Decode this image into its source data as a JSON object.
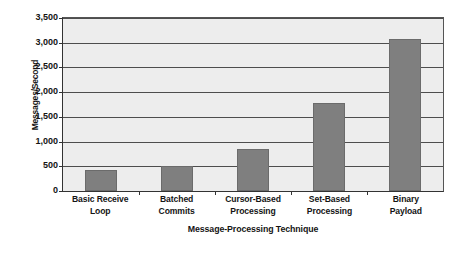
{
  "chart_data": {
    "type": "bar",
    "title": "",
    "xlabel": "Message-Processing Technique",
    "ylabel": "Messages/Second",
    "categories": [
      "Basic Receive\nLoop",
      "Batched\nCommits",
      "Cursor-Based\nProcessing",
      "Set-Based\nProcessing",
      "Binary\nPayload"
    ],
    "category_lines": [
      [
        "Basic Receive",
        "Loop"
      ],
      [
        "Batched",
        "Commits"
      ],
      [
        "Cursor-Based",
        "Processing"
      ],
      [
        "Set-Based",
        "Processing"
      ],
      [
        "Binary",
        "Payload"
      ]
    ],
    "values": [
      430,
      510,
      860,
      1780,
      3070
    ],
    "ylim": [
      0,
      3500
    ],
    "ytick_values": [
      0,
      500,
      1000,
      1500,
      2000,
      2500,
      3000,
      3500
    ],
    "ytick_labels": [
      "0",
      "500",
      "1,000",
      "1,500",
      "2,000",
      "2,500",
      "3,000",
      "3,500"
    ],
    "grid": true,
    "legend": "none",
    "colors": {
      "bar_fill": "#7f7f7f",
      "bar_edge": "#6b6b6b",
      "plot_background": "#ededed",
      "gridline": "#4d4d4d",
      "axis": "#333333",
      "text": "#141414",
      "page_background": "#ffffff"
    }
  }
}
